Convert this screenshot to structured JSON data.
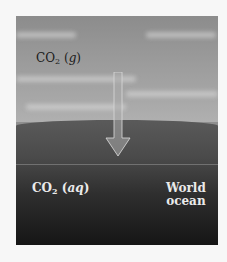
{
  "figure": {
    "atmosphere_label": {
      "formula": "CO",
      "subscript": "2",
      "phase_open": " (",
      "phase": "g",
      "phase_close": ")"
    },
    "ocean_label": {
      "formula": "CO",
      "subscript": "2",
      "phase_open": " (",
      "phase": "aq",
      "phase_close": ")"
    },
    "ocean_name": {
      "line1": "World",
      "line2": "ocean"
    },
    "arrow": {
      "direction": "down",
      "meaning": "CO2 dissolution from atmosphere into ocean"
    },
    "colors": {
      "sky": "#9a9a9a",
      "ocean_top": "#5a5a5a",
      "ocean_bottom": "#151515",
      "arrow": "#b8b8b8",
      "text_dark": "#1a1a1a",
      "text_light": "#eaeaea"
    }
  }
}
